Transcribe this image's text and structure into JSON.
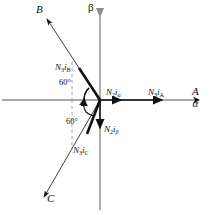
{
  "figure": {
    "type": "phasor-vector-diagram",
    "width": 209,
    "height": 215
  },
  "colors": {
    "axis": "#8c8c8c",
    "vector": "#111111",
    "dashed": "#9a9a9a",
    "text": "#111111",
    "background": "#ffffff"
  },
  "geometry": {
    "origin": {
      "x": 100,
      "y": 100
    },
    "alpha_axis": {
      "x1": 2,
      "y1": 100,
      "x2": 205,
      "y2": 100
    },
    "beta_axis": {
      "x1": 100,
      "y1": 10,
      "x2": 100,
      "y2": 210
    },
    "b_axis": {
      "x1": 100,
      "y1": 100,
      "x2": 44,
      "y2": 14
    },
    "c_axis": {
      "x1": 100,
      "y1": 100,
      "x2": 41,
      "y2": 201
    },
    "vector_n3ib": {
      "x1": 100,
      "y1": 100,
      "x2": 78,
      "y2": 67
    },
    "vector_n3ic": {
      "x1": 100,
      "y1": 100,
      "x2": 86,
      "y2": 136
    },
    "vector_n2ia": {
      "x1": 100,
      "y1": 100,
      "x2": 123,
      "y2": 100
    },
    "vector_n3ia": {
      "x1": 100,
      "y1": 100,
      "x2": 160,
      "y2": 100
    },
    "vector_n2ib": {
      "x1": 100,
      "y1": 100,
      "x2": 100,
      "y2": 131
    },
    "dashed_upper": {
      "x": 72,
      "y1": 60,
      "y2": 100
    },
    "dashed_lower": {
      "x": 72,
      "y1": 100,
      "y2": 148
    }
  },
  "labels": {
    "axis_b": "B",
    "axis_c": "C",
    "axis_beta": "β",
    "axis_A": "A",
    "axis_alpha": "α",
    "vector_n3ib": {
      "n": "N",
      "n_sub": "3",
      "i": "i",
      "i_sub": "B"
    },
    "vector_n3ic": {
      "n": "N",
      "n_sub": "3",
      "i": "i",
      "i_sub": "C"
    },
    "vector_n3ia": {
      "n": "N",
      "n_sub": "3",
      "i": "i",
      "i_sub": "A"
    },
    "vector_n2ia": {
      "n": "N",
      "n_sub": "2",
      "i": "i",
      "i_sub": "α"
    },
    "vector_n2ib": {
      "n": "N",
      "n_sub": "2",
      "i": "i",
      "i_sub": "β"
    },
    "angle_upper": "60°",
    "angle_lower": "60°"
  },
  "annotations": {
    "angle_upper_value": 60,
    "angle_lower_value": 60,
    "angle_unit": "degrees"
  }
}
